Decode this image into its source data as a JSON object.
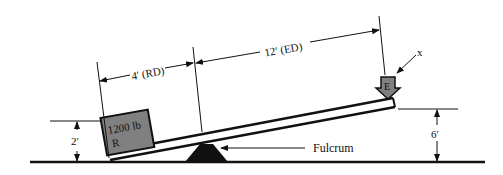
{
  "diagram": {
    "type": "lever",
    "labels": {
      "resistance_distance": "4′ (RD)",
      "effort_distance": "12′ (ED)",
      "load_weight": "1200 lb",
      "load_symbol": "R",
      "effort_symbol": "E",
      "pointer_label": "x",
      "fulcrum": "Fulcrum",
      "left_height": "2′",
      "right_height": "6′"
    },
    "colors": {
      "ink": "#111111",
      "box_fill": "#808080",
      "background": "#ffffff"
    }
  }
}
